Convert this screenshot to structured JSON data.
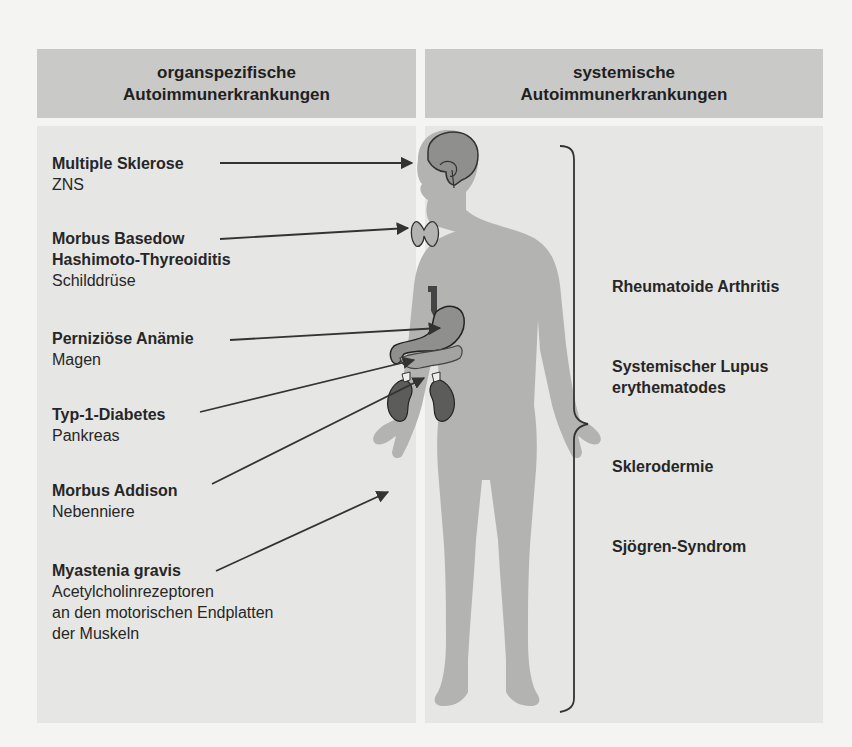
{
  "headers": {
    "left": {
      "line1": "organspezifische",
      "line2": "Autoimmunerkrankungen"
    },
    "right": {
      "line1": "systemische",
      "line2": "Autoimmunerkrankungen"
    }
  },
  "organ_specific": [
    {
      "disease": "Multiple Sklerose",
      "organ": "ZNS"
    },
    {
      "disease": "Morbus Basedow",
      "disease2": "Hashimoto-Thyreoiditis",
      "organ": "Schilddrüse"
    },
    {
      "disease": "Perniziöse Anämie",
      "organ": "Magen"
    },
    {
      "disease": "Typ-1-Diabetes",
      "organ": "Pankreas"
    },
    {
      "disease": "Morbus Addison",
      "organ": "Nebenniere"
    },
    {
      "disease": "Myastenia gravis",
      "organ": "Acetylcholinrezeptoren",
      "organ2": "an den motorischen Endplatten",
      "organ3": "der Muskeln"
    }
  ],
  "systemic": [
    {
      "line1": "Rheumatoide Arthritis"
    },
    {
      "line1": "Systemischer Lupus",
      "line2": "erythematodes"
    },
    {
      "line1": "Sklerodermie"
    },
    {
      "line1": "Sjögren-Syndrom"
    }
  ],
  "colors": {
    "header_bg": "#c9c9c8",
    "panel_bg": "#e6e6e5",
    "body_silhouette": "#b3b3b2",
    "organ_fill": "#8f8f8e",
    "organ_dark": "#5c5c5b",
    "line": "#333333"
  }
}
